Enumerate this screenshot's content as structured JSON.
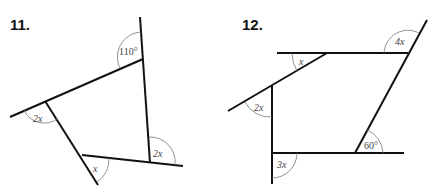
{
  "problems": [
    {
      "number": "11.",
      "angles": [
        {
          "label": "110°",
          "position": "top-right vertex, exterior"
        },
        {
          "label": "2x",
          "position": "left vertex, exterior"
        },
        {
          "label": "2x",
          "position": "bottom-right vertex, exterior"
        },
        {
          "label": "x",
          "position": "bottom vertex, exterior"
        }
      ]
    },
    {
      "number": "12.",
      "angles": [
        {
          "label": "4x",
          "position": "top-right vertex, exterior"
        },
        {
          "label": "x",
          "position": "top-left vertex, exterior"
        },
        {
          "label": "2x",
          "position": "left upper vertex, exterior"
        },
        {
          "label": "3x",
          "position": "bottom-left vertex, exterior"
        },
        {
          "label": "60°",
          "position": "bottom-right vertex, exterior"
        }
      ]
    }
  ],
  "colors": {
    "line": "#111111",
    "arc": "#777777",
    "label": "#444444"
  }
}
